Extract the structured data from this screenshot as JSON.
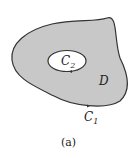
{
  "diagram": {
    "region_label": "D",
    "inner_curve_label": "C",
    "inner_curve_sub": "2",
    "outer_curve_label": "C",
    "outer_curve_sub": "1",
    "caption": "(a)",
    "colors": {
      "region_fill": "#c8c8c8",
      "curve_stroke": "#333333",
      "hole_fill": "#ffffff"
    }
  }
}
